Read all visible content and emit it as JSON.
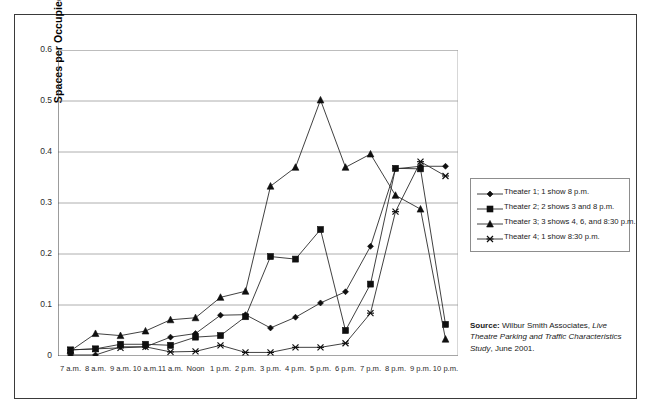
{
  "chart_data": {
    "type": "line",
    "title": "",
    "xlabel": "",
    "ylabel": "Spaces per Occupied Seat",
    "ylim": [
      0,
      0.6
    ],
    "yticks": [
      "0",
      "0.1",
      "0.2",
      "0.3",
      "0.4",
      "0.5",
      "0.6"
    ],
    "ytick_values": [
      0,
      0.1,
      0.2,
      0.3,
      0.4,
      0.5,
      0.6
    ],
    "grid": "horizontal",
    "legend_position": "right",
    "categories": [
      "7 a.m.",
      "8 a.m.",
      "9 a.m.",
      "10 a.m.",
      "11 a.m.",
      "Noon",
      "1 p.m.",
      "2 p.m.",
      "3 p.m.",
      "4 p.m.",
      "5 p.m.",
      "6 p.m.",
      "7 p.m.",
      "8 p.m.",
      "9 p.m.",
      "10 p.m."
    ],
    "series": [
      {
        "name": "Theater 1; 1 show 8 p.m.",
        "marker": "diamond",
        "values": [
          0.002,
          0.002,
          0.018,
          0.018,
          0.037,
          0.044,
          0.08,
          0.081,
          0.055,
          0.076,
          0.104,
          0.126,
          0.215,
          0.367,
          0.372,
          0.372
        ]
      },
      {
        "name": "Theater 2; 2 shows 3 and 8 p.m.",
        "marker": "square",
        "values": [
          0.012,
          0.014,
          0.023,
          0.023,
          0.021,
          0.037,
          0.04,
          0.077,
          0.195,
          0.19,
          0.248,
          0.05,
          0.141,
          0.368,
          0.367,
          0.062
        ]
      },
      {
        "name": "Theater 3; 3 shows 4, 6, and 8:30 p.m.",
        "marker": "triangle",
        "values": [
          0.01,
          0.044,
          0.04,
          0.049,
          0.071,
          0.075,
          0.115,
          0.127,
          0.333,
          0.37,
          0.502,
          0.37,
          0.396,
          0.315,
          0.288,
          0.033
        ]
      },
      {
        "name": "Theater 4; 1 show 8:30 p.m.",
        "marker": "x-cross",
        "values": [
          0.012,
          0.014,
          0.016,
          0.018,
          0.008,
          0.009,
          0.021,
          0.007,
          0.007,
          0.017,
          0.017,
          0.025,
          0.084,
          0.283,
          0.381,
          0.353
        ]
      }
    ]
  },
  "legend": {
    "entries": [
      {
        "label": "Theater 1; 1 show 8 p.m.",
        "marker": "diamond"
      },
      {
        "label": "Theater 2; 2 shows 3 and 8 p.m.",
        "marker": "square"
      },
      {
        "label": "Theater 3; 3 shows 4, 6, and 8:30 p.m.",
        "marker": "triangle"
      },
      {
        "label": "Theater 4; 1 show 8:30 p.m.",
        "marker": "x-cross"
      }
    ]
  },
  "source": {
    "lead": "Source:",
    "text_plain_1": " Wilbur Smith Associates, ",
    "text_italic": "Live Theatre Parking and Traffic Characteristics Study",
    "text_plain_2": ", June 2001."
  },
  "colors": {
    "line": "#2b2b2b",
    "marker": "#0f0f0f",
    "grid": "#9a9a9a",
    "axis": "#4a4a4a",
    "frame": "#3a3a3a",
    "text": "#1a1a1a"
  }
}
